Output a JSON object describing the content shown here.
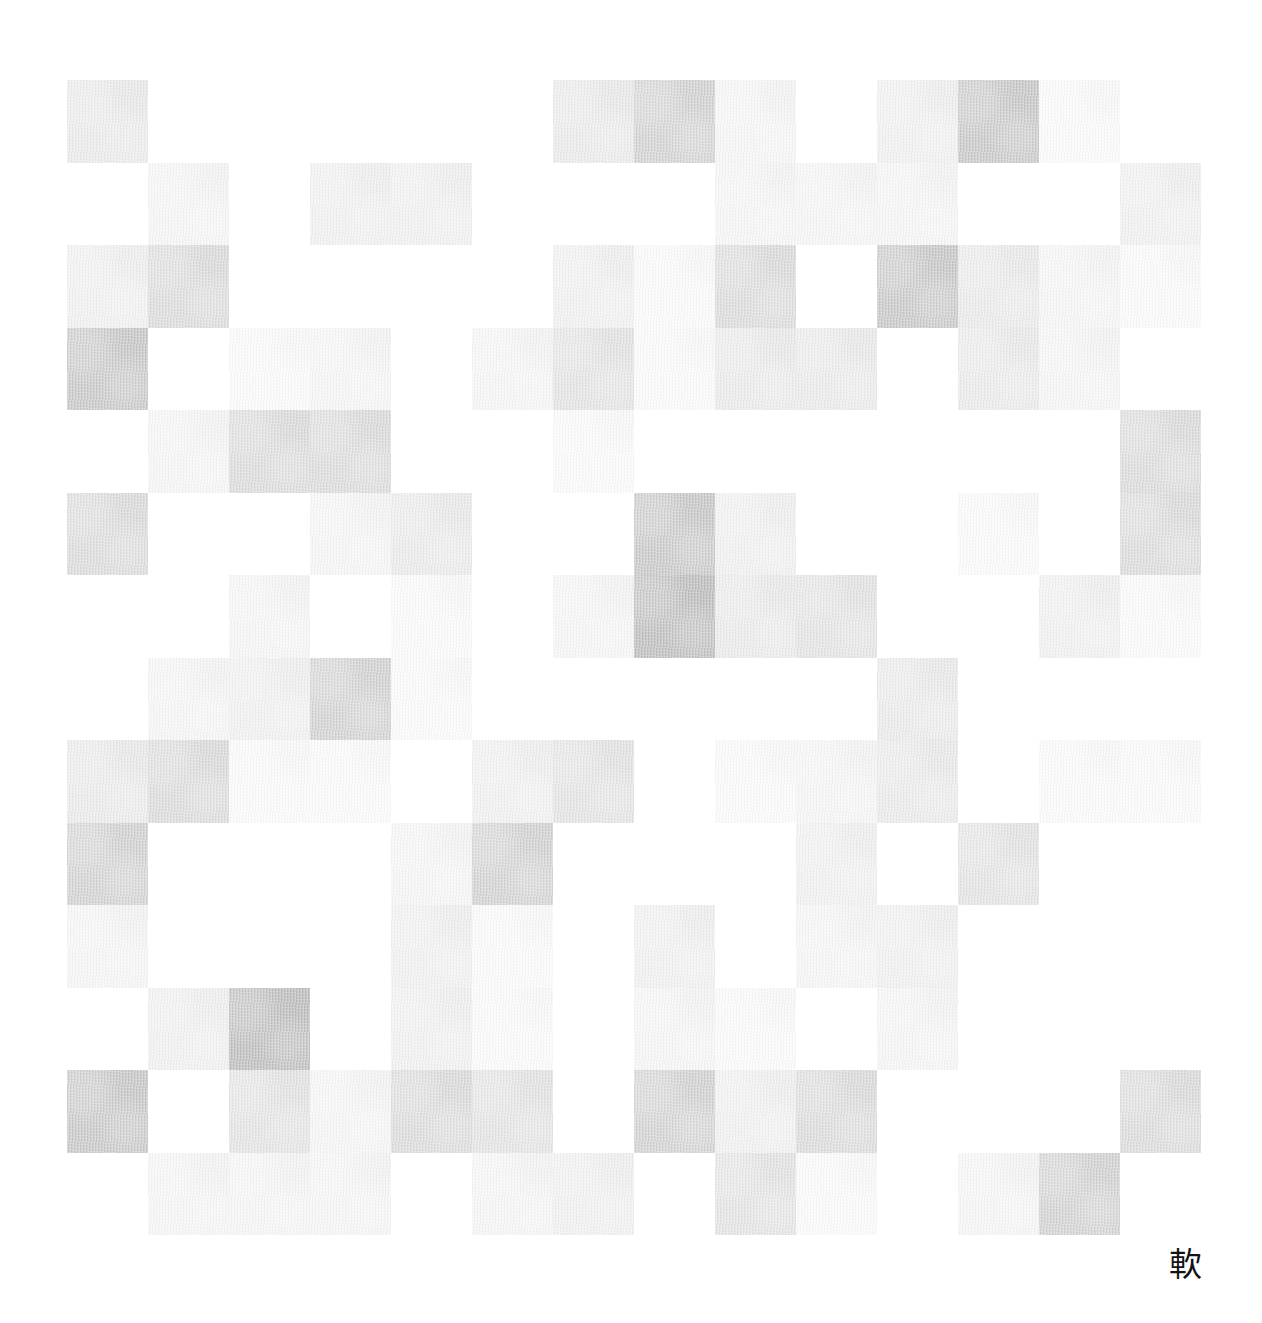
{
  "artwork": {
    "title": "Abstract Grid Mosaic",
    "medium_note": "watercolour grid on textured paper",
    "background_color": "#ffffff",
    "signature": {
      "character": "軟",
      "color": "#131313"
    },
    "palette": {
      "blank": "#ffffff",
      "tint_1": "#fbfbfb",
      "tint_2": "#f6f6f6",
      "tint_3": "#f1f1f1",
      "tint_4": "#ebebeb",
      "tint_5": "#e4e4e4",
      "tint_6": "#dcdcdc",
      "tint_7": "#d3d3d3",
      "tint_8": "#c9c9c9",
      "tint_9": "#bfbfbf",
      "tint_10": "#b4b4b4"
    },
    "grid": {
      "columns": 14,
      "rows": 14,
      "left": 67,
      "top": 80,
      "width": 1134,
      "height": 1155,
      "cell_width": 81,
      "cell_height": 82.5
    }
  },
  "chart_data": {
    "type": "heatmap",
    "xlabel": "",
    "ylabel": "",
    "grid": false,
    "legend_position": "none",
    "colormap": "greys",
    "vmin": 0,
    "vmax": 10,
    "note": "Each value is the painted ink density of one square, 0 = bare paper, 10 = darkest grey.",
    "x": [
      0,
      1,
      2,
      3,
      4,
      5,
      6,
      7,
      8,
      9,
      10,
      11,
      12,
      13
    ],
    "y": [
      0,
      1,
      2,
      3,
      4,
      5,
      6,
      7,
      8,
      9,
      10,
      11,
      12,
      13
    ],
    "values": [
      [
        4,
        0,
        0,
        0,
        0,
        0,
        4,
        7,
        2,
        0,
        3,
        8,
        1,
        0
      ],
      [
        0,
        2,
        0,
        3,
        3,
        0,
        0,
        0,
        2,
        2,
        2,
        0,
        0,
        3
      ],
      [
        3,
        6,
        0,
        0,
        0,
        0,
        3,
        1,
        6,
        0,
        8,
        4,
        2,
        1
      ],
      [
        8,
        0,
        1,
        2,
        0,
        2,
        5,
        1,
        4,
        4,
        0,
        4,
        2,
        0
      ],
      [
        0,
        2,
        6,
        6,
        0,
        0,
        1,
        0,
        0,
        0,
        0,
        0,
        0,
        6
      ],
      [
        6,
        0,
        0,
        2,
        4,
        0,
        0,
        8,
        3,
        0,
        0,
        1,
        0,
        6
      ],
      [
        0,
        0,
        2,
        0,
        1,
        0,
        2,
        9,
        4,
        5,
        0,
        0,
        3,
        1
      ],
      [
        0,
        2,
        3,
        7,
        1,
        0,
        0,
        0,
        0,
        0,
        4,
        0,
        0,
        0
      ],
      [
        4,
        6,
        1,
        1,
        0,
        3,
        5,
        0,
        1,
        2,
        4,
        0,
        1,
        1
      ],
      [
        7,
        0,
        0,
        0,
        2,
        7,
        0,
        0,
        0,
        3,
        0,
        5,
        0,
        0
      ],
      [
        2,
        0,
        0,
        0,
        3,
        1,
        0,
        3,
        0,
        2,
        3,
        0,
        0,
        0
      ],
      [
        0,
        3,
        9,
        0,
        3,
        1,
        0,
        2,
        1,
        0,
        2,
        0,
        0,
        0
      ],
      [
        8,
        0,
        5,
        2,
        6,
        5,
        0,
        7,
        3,
        6,
        0,
        0,
        0,
        6
      ],
      [
        0,
        2,
        2,
        2,
        0,
        2,
        3,
        0,
        5,
        1,
        0,
        2,
        7,
        0
      ]
    ]
  }
}
